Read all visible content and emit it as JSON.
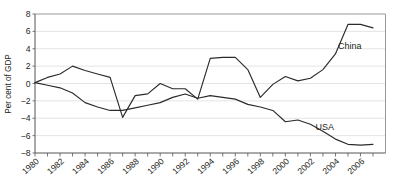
{
  "chart_data": {
    "type": "line",
    "title": "",
    "xlabel": "",
    "ylabel": "Per cent of GDP",
    "xlim": [
      1980,
      2008
    ],
    "ylim": [
      -8,
      8
    ],
    "grid": true,
    "legend_position": "inline-right",
    "y_ticks": [
      8,
      6,
      4,
      2,
      0,
      -2,
      -4,
      -6,
      -8
    ],
    "y_tick_labels": [
      "8",
      "6",
      "4",
      "2",
      "0",
      "−2",
      "−4",
      "−6",
      "−8"
    ],
    "x_ticks": [
      1980,
      1981,
      1982,
      1983,
      1984,
      1985,
      1986,
      1987,
      1988,
      1989,
      1990,
      1991,
      1992,
      1993,
      1994,
      1995,
      1996,
      1997,
      1998,
      1999,
      2000,
      2001,
      2002,
      2003,
      2004,
      2005,
      2006,
      2007
    ],
    "x_tick_labels": [
      "1980",
      "1982",
      "1984",
      "1986",
      "1988",
      "1990",
      "1992",
      "1994",
      "1996",
      "1998",
      "2000",
      "2002",
      "2004",
      "2006"
    ],
    "x_tick_label_values": [
      1980,
      1982,
      1984,
      1986,
      1988,
      1990,
      1992,
      1994,
      1996,
      1998,
      2000,
      2002,
      2004,
      2006
    ],
    "x": [
      1980,
      1981,
      1982,
      1983,
      1984,
      1985,
      1986,
      1987,
      1988,
      1989,
      1990,
      1991,
      1992,
      1993,
      1994,
      1995,
      1996,
      1997,
      1998,
      1999,
      2000,
      2001,
      2002,
      2003,
      2004,
      2005,
      2006,
      2007
    ],
    "series": [
      {
        "name": "China",
        "label": "China",
        "color": "#2b2b2b",
        "values": [
          0.1,
          0.7,
          1.1,
          2.0,
          1.5,
          1.1,
          0.7,
          -3.9,
          -1.4,
          -1.2,
          0.0,
          -0.6,
          -0.6,
          -1.8,
          2.9,
          3.0,
          3.0,
          1.6,
          -1.6,
          -0.1,
          0.8,
          0.3,
          0.6,
          1.6,
          3.4,
          6.8,
          6.8,
          6.4
        ]
      },
      {
        "name": "USA",
        "label": "USA",
        "color": "#2b2b2b",
        "values": [
          0.1,
          -0.2,
          -0.5,
          -1.1,
          -2.2,
          -2.7,
          -3.1,
          -3.1,
          -2.8,
          -2.5,
          -2.2,
          -1.6,
          -1.2,
          -1.7,
          -1.4,
          -1.6,
          -1.8,
          -2.4,
          -2.7,
          -3.1,
          -4.4,
          -4.2,
          -4.7,
          -5.5,
          -6.4,
          -7.0,
          -7.1,
          -7.0
        ]
      }
    ],
    "annotations": [
      {
        "text": "China",
        "x": 2004.2,
        "y": 4.0
      },
      {
        "text": "USA",
        "x": 2002.4,
        "y": -5.4
      }
    ]
  }
}
